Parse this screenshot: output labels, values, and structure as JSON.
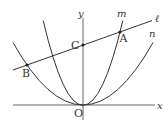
{
  "figure": {
    "type": "coordinate-geometry",
    "axes": {
      "x_label": "x",
      "y_label": "y",
      "origin_label": "O"
    },
    "curves": [
      {
        "name": "m",
        "label": "m",
        "kind": "parabola",
        "vertex": "O",
        "width": "narrow"
      },
      {
        "name": "n",
        "label": "n",
        "kind": "parabola",
        "vertex": "O",
        "width": "wide"
      }
    ],
    "lines": [
      {
        "name": "l",
        "label": "ℓ",
        "passes_through": [
          "B",
          "C",
          "A"
        ]
      }
    ],
    "points": [
      {
        "name": "A",
        "label": "A",
        "on": [
          "m",
          "ℓ"
        ]
      },
      {
        "name": "B",
        "label": "B",
        "on": [
          "n",
          "ℓ"
        ]
      },
      {
        "name": "C",
        "label": "C",
        "on": [
          "y-axis",
          "ℓ"
        ]
      },
      {
        "name": "O",
        "label": "O",
        "on": [
          "origin"
        ]
      }
    ],
    "colors": {
      "stroke": "#333333",
      "axis": "#555555",
      "background": "#ffffff"
    }
  }
}
